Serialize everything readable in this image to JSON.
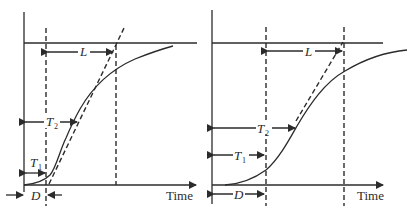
{
  "diagram": {
    "panels": [
      {
        "id": "left",
        "x_axis_label": "Time",
        "labels": {
          "L": "L",
          "T2": "T",
          "T2_sub": "2",
          "T1": "T",
          "T1_sub": "1",
          "D": "D"
        }
      },
      {
        "id": "right",
        "x_axis_label": "Time",
        "labels": {
          "L": "L",
          "T2": "T",
          "T2_sub": "2",
          "T1": "T",
          "T1_sub": "1",
          "D": "D"
        }
      }
    ],
    "colors": {
      "ink": "#2b2b2b",
      "background": "#ffffff"
    }
  }
}
